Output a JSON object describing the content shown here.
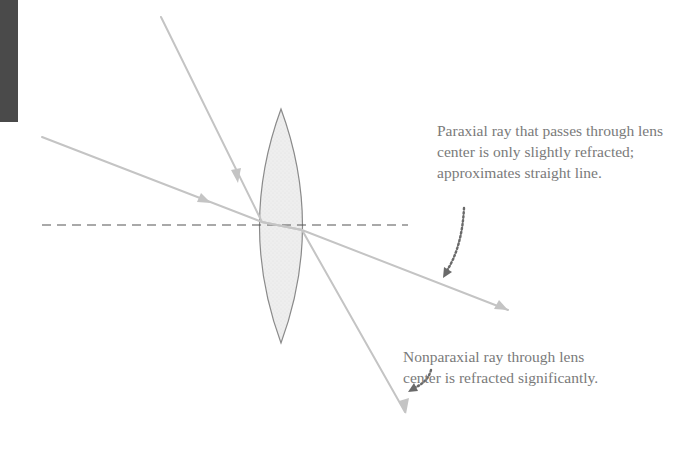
{
  "colors": {
    "ray": "#c4c4c4",
    "lens_fill": "#ececec",
    "lens_stroke": "#8a8a8a",
    "axis": "#555555",
    "text": "#7a7a7a",
    "pointer": "#6a6a6a",
    "edge_tab": "#4a4a4a"
  },
  "diagram": {
    "elements": {
      "lens": "biconvex-lens",
      "optical_axis": "dashed-horizontal-line",
      "rays": [
        "paraxial-ray",
        "nonparaxial-ray"
      ]
    }
  },
  "annotations": {
    "paraxial": {
      "lines": [
        "Paraxial ray that passes through lens",
        "center is only slightly refracted;",
        "approximates straight line."
      ]
    },
    "nonparaxial": {
      "lines": [
        "Nonparaxial ray through lens",
        "center is refracted significantly."
      ]
    }
  }
}
